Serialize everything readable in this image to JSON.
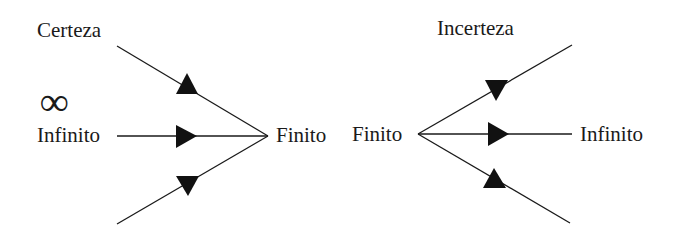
{
  "left_diagram": {
    "title": "Certeza",
    "symbol": "∞",
    "source_label": "Infinito",
    "target_label": "Finito",
    "description": "Three arrows converge from the left into Finito"
  },
  "right_diagram": {
    "title": "Incerteza",
    "source_label": "Finito",
    "target_label": "Infinito",
    "description": "Three arrows diverge from Finito to the right"
  },
  "colors": {
    "line": "#1a1a1a",
    "background": "#ffffff"
  }
}
